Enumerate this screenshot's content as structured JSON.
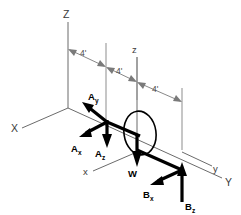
{
  "diagram": {
    "background_color": "#ffffff",
    "force_color": "#000000",
    "axis_color": "#6b6b6b",
    "guide_color": "#8d8d8d",
    "axes": [
      {
        "id": "axis-Z-upper",
        "label": "Z",
        "case": "upper",
        "direction": "vertical-up"
      },
      {
        "id": "axis-X-upper",
        "label": "X",
        "case": "upper",
        "direction": "down-left"
      },
      {
        "id": "axis-Y-upper",
        "label": "Y",
        "case": "upper",
        "direction": "down-right"
      },
      {
        "id": "axis-z-lower",
        "label": "z",
        "case": "lower",
        "direction": "vertical-up"
      },
      {
        "id": "axis-x-lower",
        "label": "x",
        "case": "lower",
        "direction": "down-left"
      },
      {
        "id": "axis-y-lower",
        "label": "y",
        "case": "lower",
        "direction": "down-right"
      }
    ],
    "dimensions": [
      {
        "id": "dim-1",
        "label": "4'",
        "value": 4,
        "unit": "ft"
      },
      {
        "id": "dim-2",
        "label": "4'",
        "value": 4,
        "unit": "ft"
      },
      {
        "id": "dim-3",
        "label": "4'",
        "value": 4,
        "unit": "ft"
      }
    ],
    "forces": [
      {
        "id": "force-Ay",
        "base": "A",
        "component": "y",
        "label": "A",
        "subscript": "y",
        "direction": "up-left"
      },
      {
        "id": "force-Ax",
        "base": "A",
        "component": "x",
        "label": "A",
        "subscript": "x",
        "direction": "down-left"
      },
      {
        "id": "force-Az",
        "base": "A",
        "component": "z",
        "label": "A",
        "subscript": "z",
        "direction": "down"
      },
      {
        "id": "force-W",
        "base": "W",
        "component": "",
        "label": "W",
        "subscript": "",
        "direction": "down"
      },
      {
        "id": "force-Bx",
        "base": "B",
        "component": "x",
        "label": "B",
        "subscript": "x",
        "direction": "down-left"
      },
      {
        "id": "force-Bz",
        "base": "B",
        "component": "z",
        "label": "B",
        "subscript": "z",
        "direction": "up"
      }
    ],
    "shapes": [
      {
        "id": "pulley-disk",
        "type": "ellipse",
        "description": "tilted disk at shaft center"
      }
    ]
  }
}
